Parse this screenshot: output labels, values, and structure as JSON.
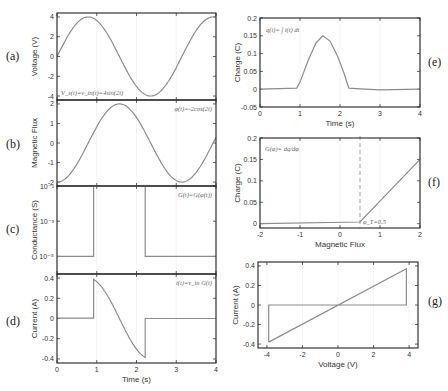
{
  "chart_data": [
    {
      "id": "a",
      "panel_label": "(a)",
      "type": "line",
      "ylabel": "Voltage (V)",
      "xlabel": "",
      "xlim": [
        0,
        4
      ],
      "ylim": [
        -4.4,
        4.4
      ],
      "yticks": [
        4,
        2,
        0,
        -2,
        -4
      ],
      "xticks": [
        0,
        1,
        2,
        3,
        4
      ],
      "annotation": "V_s(t)=v_in(t)=4sin(2t)",
      "function": "4*sin(2t)"
    },
    {
      "id": "b",
      "panel_label": "(b)",
      "type": "line",
      "ylabel": "Magnetic Flux",
      "xlabel": "",
      "xlim": [
        0,
        4
      ],
      "ylim": [
        -2.2,
        2.2
      ],
      "yticks": [
        2,
        1,
        0,
        -1,
        -2
      ],
      "xticks": [
        0,
        1,
        2,
        3,
        4
      ],
      "annotation": "φ(t)=-2cos(2t)",
      "function": "-2*cos(2t)"
    },
    {
      "id": "c",
      "panel_label": "(c)",
      "type": "line",
      "ylabel": "Conductance (S)",
      "xlabel": "",
      "yscale": "log",
      "xlim": [
        0,
        4
      ],
      "ylim_exp": [
        -6,
        -1
      ],
      "yticks": [
        "10⁻¹",
        "10⁻³",
        "10⁻⁵"
      ],
      "xticks": [
        0,
        1,
        2,
        3,
        4
      ],
      "annotation": "G(t)=G(φ(t))",
      "x": [
        0,
        0.92,
        0.92,
        2.22,
        2.22,
        4
      ],
      "y_exp": [
        -5,
        -5,
        -1,
        -1,
        -5,
        -5
      ]
    },
    {
      "id": "d",
      "panel_label": "(d)",
      "type": "line",
      "ylabel": "Current (A)",
      "xlabel": "Time (s)",
      "xlim": [
        0,
        4
      ],
      "ylim": [
        -0.44,
        0.44
      ],
      "yticks": [
        0.4,
        0.2,
        0,
        -0.2,
        -0.4
      ],
      "xticks": [
        0,
        1,
        2,
        3,
        4
      ],
      "annotation": "i(t)=v_in G(t)",
      "function": "0.1*sin(2t) for 0.92<t<2.22 else ~0"
    },
    {
      "id": "e",
      "panel_label": "(e)",
      "type": "line",
      "ylabel": "Charge (C)",
      "xlabel": "Time (s)",
      "xlim": [
        0,
        4
      ],
      "ylim": [
        -0.05,
        0.2
      ],
      "yticks": [
        0.2,
        0.15,
        0.1,
        0.05,
        0,
        -0.05
      ],
      "xticks": [
        0,
        1,
        2,
        3,
        4
      ],
      "annotation": "q(t)=∫ i(t) dt",
      "x": [
        0,
        0.92,
        1.0,
        1.2,
        1.4,
        1.57,
        1.75,
        1.95,
        2.1,
        2.22,
        2.5,
        3,
        4
      ],
      "y": [
        0,
        0.003,
        0.02,
        0.08,
        0.13,
        0.15,
        0.135,
        0.09,
        0.045,
        0.003,
        0.001,
        -0.002,
        0
      ]
    },
    {
      "id": "f",
      "panel_label": "(f)",
      "type": "line",
      "ylabel": "Charge (C)",
      "xlabel": "Magnetic Flux",
      "xlim": [
        -2,
        2
      ],
      "ylim": [
        -0.01,
        0.2
      ],
      "yticks": [
        0.2,
        0.15,
        0.1,
        0.05,
        0
      ],
      "xticks": [
        -2,
        -1,
        0,
        1,
        2
      ],
      "annotation": "G(φ)= dq/dφ",
      "threshold_label": "φ_T=0.5",
      "threshold_x": 0.5,
      "x": [
        -2,
        0.5,
        2
      ],
      "y": [
        0,
        0.004,
        0.15
      ]
    },
    {
      "id": "g",
      "panel_label": "(g)",
      "type": "line",
      "ylabel": "Current (A)",
      "xlabel": "Voltage (V)",
      "xlim": [
        -4.5,
        4.5
      ],
      "ylim": [
        -0.44,
        0.44
      ],
      "yticks": [
        0.4,
        0.2,
        0,
        -0.2,
        -0.4
      ],
      "xticks": [
        -4,
        -2,
        0,
        2,
        4
      ],
      "x": [
        -3.9,
        3.85,
        3.85,
        -3.9,
        -3.9
      ],
      "y": [
        -0.38,
        0.37,
        0,
        0,
        -0.38
      ]
    }
  ],
  "labels": {
    "a": "(a)",
    "b": "(b)",
    "c": "(c)",
    "d": "(d)",
    "e": "(e)",
    "f": "(f)",
    "g": "(g)",
    "ylabel_a": "Voltage (V)",
    "ylabel_b": "Magnetic Flux",
    "ylabel_c": "Conductance (S)",
    "ylabel_d": "Current (A)",
    "xlabel_d": "Time (s)",
    "ylabel_e": "Charge (C)",
    "xlabel_e": "Time (s)",
    "ylabel_f": "Charge (C)",
    "xlabel_f": "Magnetic Flux",
    "ylabel_g": "Current (A)",
    "xlabel_g": "Voltage (V)",
    "ann_a": "V_s(t)=v_in(t)=4sin(2t)",
    "ann_b": "φ(t)=-2cos(2t)",
    "ann_c": "G(t)=G(φ(t))",
    "ann_d": "i(t)=v_in G(t)",
    "ann_e": "q(t)= ∫ i(t) dt",
    "ann_f": "G(φ)= dq/dφ",
    "ann_f_thr": "φ_T=0.5"
  },
  "colors": {
    "curve": "#8c8c8c",
    "axis": "#222222",
    "grid": "#ececec",
    "threshold": "#888888"
  }
}
